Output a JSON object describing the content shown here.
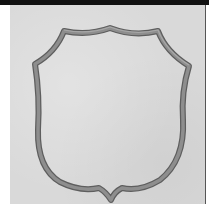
{
  "image": {
    "subject": "shield-outline",
    "colors": {
      "background": "#d9d9d9",
      "stroke_outer": "#8a8a8a",
      "stroke_inner": "#5e5e5e",
      "top_bar": "#111111",
      "right_rule": "#555555"
    }
  }
}
